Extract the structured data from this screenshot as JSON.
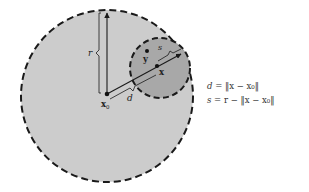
{
  "diagram": {
    "colors": {
      "outer_fill": "#cccccc",
      "inner_fill": "#a8a8a8",
      "stroke": "#1a1a1a",
      "background": "#ffffff"
    },
    "outer_circle": {
      "cx": 107,
      "cy": 96,
      "r": 86,
      "style": "dashed"
    },
    "inner_circle": {
      "cx": 160,
      "cy": 68,
      "r": 30,
      "style": "dashed"
    },
    "points": {
      "x0": {
        "x": 107,
        "y": 94,
        "label": "x",
        "subscript": "0"
      },
      "x": {
        "x": 157,
        "y": 66,
        "label": "x"
      },
      "y": {
        "x": 147,
        "y": 51,
        "label": "y"
      }
    },
    "labels": {
      "r": "r",
      "d": "d",
      "s": "s"
    },
    "equations": [
      {
        "lhs": "d",
        "rhs_text": "= ‖x − x₀‖"
      },
      {
        "lhs": "s",
        "rhs_text": "= r − ‖x − x₀‖"
      }
    ]
  }
}
